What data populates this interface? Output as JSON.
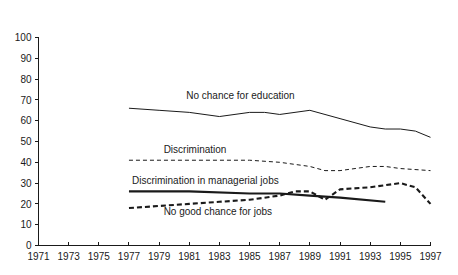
{
  "chart_data": {
    "type": "line",
    "title": "",
    "subtitle": "",
    "xlabel": "",
    "ylabel": "",
    "xlim": [
      1971,
      1997
    ],
    "ylim": [
      0,
      100
    ],
    "grid": false,
    "legend_position": "inline-annotations",
    "x_tick_labels": [
      "1971",
      "1973",
      "1975",
      "1977",
      "1979",
      "1981",
      "1983",
      "1985",
      "1987",
      "1989",
      "1991",
      "1993",
      "1995",
      "1997"
    ],
    "x_tick_values": [
      1971,
      1973,
      1975,
      1977,
      1979,
      1981,
      1983,
      1985,
      1987,
      1989,
      1991,
      1993,
      1995,
      1997
    ],
    "y_tick_labels": [
      "0",
      "10",
      "20",
      "30",
      "40",
      "50",
      "60",
      "70",
      "80",
      "90",
      "100"
    ],
    "y_tick_values": [
      0,
      10,
      20,
      30,
      40,
      50,
      60,
      70,
      80,
      90,
      100
    ],
    "series": [
      {
        "name": "No chance for education",
        "style": "solid-thin",
        "x": [
          1977,
          1979,
          1981,
          1983,
          1985,
          1986,
          1987,
          1989,
          1991,
          1993,
          1994,
          1995,
          1996,
          1997
        ],
        "values": [
          66,
          65,
          64,
          62,
          64,
          64,
          63,
          65,
          61,
          57,
          56,
          56,
          55,
          52
        ]
      },
      {
        "name": "Discrimination",
        "style": "dashed-thin",
        "x": [
          1977,
          1979,
          1981,
          1983,
          1985,
          1987,
          1989,
          1990,
          1991,
          1993,
          1994,
          1995,
          1997
        ],
        "values": [
          41,
          41,
          41,
          41,
          41,
          40,
          38,
          36,
          36,
          38,
          38,
          37,
          36
        ]
      },
      {
        "name": "Discrimination in managerial jobs",
        "style": "solid-thick",
        "x": [
          1977,
          1981,
          1985,
          1987,
          1989,
          1991,
          1994
        ],
        "values": [
          26,
          26,
          25,
          25,
          24,
          23,
          21
        ]
      },
      {
        "name": "No good chance for jobs",
        "style": "dashed-thick",
        "x": [
          1977,
          1979,
          1981,
          1983,
          1985,
          1987,
          1988,
          1989,
          1990,
          1991,
          1993,
          1995,
          1996,
          1997
        ],
        "values": [
          18,
          19,
          20,
          21,
          22,
          24,
          26,
          26,
          22,
          27,
          28,
          30,
          28,
          20
        ]
      }
    ],
    "annotations": [
      {
        "text": "No chance for education",
        "x": 1980.8,
        "y": 70.5
      },
      {
        "text": "Discrimination",
        "x": 1979.3,
        "y": 44.5
      },
      {
        "text": "Discrimination in managerial jobs",
        "x": 1977.2,
        "y": 29.5
      },
      {
        "text": "No good chance for jobs",
        "x": 1979.3,
        "y": 14.5
      }
    ],
    "colors": {
      "axis": "#1a1a1a",
      "line": "#1a1a1a",
      "background": "#ffffff"
    }
  }
}
